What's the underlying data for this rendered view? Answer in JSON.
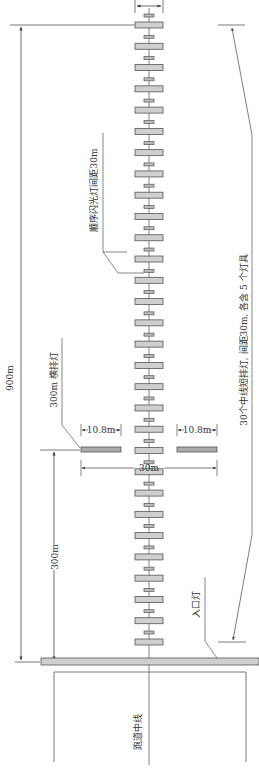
{
  "diagram": {
    "colors": {
      "line": "#555555",
      "bar_fill": "#cfcfcf",
      "bar_stroke": "#555555",
      "text": "#333333",
      "background": "#ffffff"
    },
    "labels": {
      "overall_length": "900m",
      "crossbar_distance": "300m",
      "crossbar_label": "300m 横排灯",
      "crossbar_arm_left": "10.8m",
      "crossbar_arm_right": "10.8m",
      "crossbar_total_width": "30m",
      "flashing_lights": "顺序闪光灯间距30m",
      "centerline_bars": "30个中线短排灯,  间距30m,  各含 5 个灯具",
      "threshold_lights": "入口灯",
      "runway_centerline": "跑道中线"
    },
    "centerline_bar_count": 30,
    "centerline_bar_spacing": "30m",
    "lamps_per_bar": 5
  }
}
